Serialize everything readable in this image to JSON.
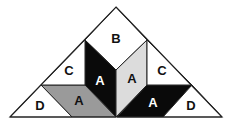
{
  "diagram": {
    "colors": {
      "outline": "#222222",
      "white": "#ffffff",
      "black": "#0a0a0a",
      "gray": "#9a9a9a",
      "light_gray": "#dcdcdc",
      "label_dark": "#111111",
      "label_light": "#ffffff"
    },
    "pieces": [
      {
        "id": "B",
        "label": "B",
        "fill": "white",
        "points": "116,7 147,40 116,70 85,40",
        "label_pos": [
          116,
          38
        ],
        "label_color": "label_dark"
      },
      {
        "id": "A-left-black",
        "label": "A",
        "fill": "black",
        "points": "85,40 116,70 116,117 85,85",
        "label_pos": [
          100,
          80
        ],
        "label_color": "label_light"
      },
      {
        "id": "A-right-light",
        "label": "A",
        "fill": "light_gray",
        "points": "147,40 147,85 116,117 116,70",
        "label_pos": [
          132,
          78
        ],
        "label_color": "label_dark"
      },
      {
        "id": "A-bottom-gray",
        "label": "A",
        "fill": "gray",
        "points": "41,85 85,85 116,117 72,117",
        "label_pos": [
          79,
          100
        ],
        "label_color": "label_dark"
      },
      {
        "id": "A-bottom-black",
        "label": "A",
        "fill": "black",
        "points": "147,85 192,85 163,117 117,117",
        "label_pos": [
          153,
          102
        ],
        "label_color": "label_light"
      },
      {
        "id": "C-left",
        "label": "C",
        "fill": "white",
        "points": "85,40 85,85 41,85",
        "label_pos": [
          69,
          70
        ],
        "label_color": "label_dark"
      },
      {
        "id": "C-right",
        "label": "C",
        "fill": "white",
        "points": "147,40 192,85 147,85",
        "label_pos": [
          162,
          70
        ],
        "label_color": "label_dark"
      },
      {
        "id": "D-left",
        "label": "D",
        "fill": "white",
        "points": "41,85 72,117 10,117",
        "label_pos": [
          40,
          105
        ],
        "label_color": "label_dark"
      },
      {
        "id": "D-right",
        "label": "D",
        "fill": "white",
        "points": "192,85 222,117 163,117",
        "label_pos": [
          191,
          105
        ],
        "label_color": "label_dark"
      }
    ],
    "outer_triangle": "116,7 222,117 10,117"
  }
}
